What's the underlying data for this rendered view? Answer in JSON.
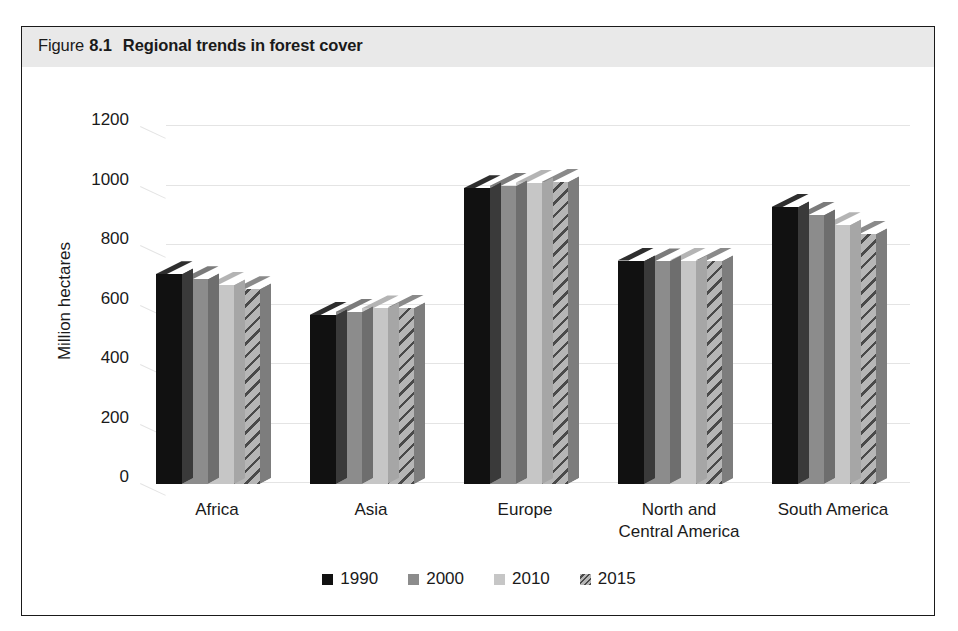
{
  "figure": {
    "label": "Figure",
    "number": "8.1",
    "caption": "Regional trends in forest cover"
  },
  "chart_data": {
    "type": "bar",
    "title": "Regional trends in forest cover",
    "xlabel": "",
    "ylabel": "Million hectares",
    "ylim": [
      0,
      1200
    ],
    "yticks": [
      0,
      200,
      400,
      600,
      800,
      1000,
      1200
    ],
    "grid": true,
    "legend_position": "bottom",
    "categories": [
      "Africa",
      "Asia",
      "Europe",
      "North and\nCentral America",
      "South America"
    ],
    "category_lines": [
      [
        "Africa"
      ],
      [
        "Asia"
      ],
      [
        "Europe"
      ],
      [
        "North and",
        "Central America"
      ],
      [
        "South America"
      ]
    ],
    "series": [
      {
        "name": "1990",
        "values": [
          705,
          568,
          994,
          751,
          931
        ]
      },
      {
        "name": "2000",
        "values": [
          688,
          578,
          1002,
          748,
          904
        ]
      },
      {
        "name": "2010",
        "values": [
          670,
          590,
          1013,
          751,
          870
        ]
      },
      {
        "name": "2015",
        "values": [
          655,
          593,
          1015,
          751,
          842
        ]
      }
    ]
  },
  "legend": {
    "items": [
      {
        "label": "1990",
        "swatch": "legend-swatch-black"
      },
      {
        "label": "2000",
        "swatch": "legend-swatch-gray"
      },
      {
        "label": "2010",
        "swatch": "legend-swatch-light-gray"
      },
      {
        "label": "2015",
        "swatch": "legend-swatch-hatched"
      }
    ]
  },
  "colors": {
    "series_1990": "#111111",
    "series_2000": "#8c8c8c",
    "series_2010": "#c6c6c6",
    "series_2015": "#9b9b9b",
    "title_band": "#e9e9e9",
    "frame": "#1a1a1a",
    "gridline": "#e4e4e4",
    "text": "#1a1a1a"
  }
}
